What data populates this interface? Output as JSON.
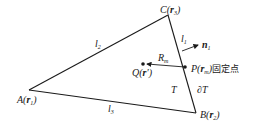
{
  "diagram": {
    "type": "triangle-element",
    "vertices": {
      "A": {
        "label": "A",
        "vec": "r",
        "sub": "1"
      },
      "B": {
        "label": "B",
        "vec": "r",
        "sub": "2"
      },
      "C": {
        "label": "C",
        "vec": "r",
        "sub": "3"
      }
    },
    "edges": {
      "l1": {
        "label": "l",
        "sub": "1"
      },
      "l2": {
        "label": "l",
        "sub": "2"
      },
      "l3": {
        "label": "l",
        "sub": "3"
      }
    },
    "normal": {
      "label": "n",
      "sub": "1"
    },
    "point_P": {
      "label": "P(",
      "vec": "r",
      "sub": "m",
      "close": ")",
      "note": "固定点"
    },
    "point_Q": {
      "label": "Q(",
      "vec": "r",
      "prime": "′",
      "close": ")"
    },
    "distance": {
      "label": "R",
      "sub": "m"
    },
    "region": {
      "label": "T"
    },
    "boundary": {
      "label": "∂T"
    }
  }
}
